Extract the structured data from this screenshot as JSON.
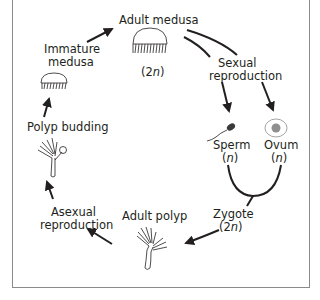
{
  "diagram": {
    "nodes": {
      "adult_medusa": {
        "label": "Adult medusa",
        "ploidy": "(2n)"
      },
      "sexual_reproduction": {
        "line1": "Sexual",
        "line2": "reproduction"
      },
      "sperm": {
        "label": "Sperm",
        "ploidy": "(n)"
      },
      "ovum": {
        "label": "Ovum",
        "ploidy": "(n)"
      },
      "zygote": {
        "label": "Zygote",
        "ploidy": "(2n)"
      },
      "adult_polyp": {
        "label": "Adult polyp"
      },
      "asexual_reproduction": {
        "line1": "Asexual",
        "line2": "reproduction"
      },
      "polyp_budding": {
        "label": "Polyp budding"
      },
      "immature_medusa": {
        "line1": "Immature",
        "line2": "medusa"
      }
    },
    "icons": [
      "adult-medusa-icon",
      "sperm-icon",
      "ovum-icon",
      "adult-polyp-icon",
      "budding-polyp-icon",
      "immature-medusa-icon"
    ],
    "colors": {
      "stroke": "#231f20",
      "frame": "#8a8a8a",
      "ovum_nucleus": "#8f8f8f",
      "ovum_outline": "#9a9a9a"
    }
  }
}
